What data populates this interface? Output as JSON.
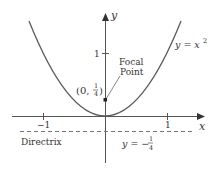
{
  "diagram": {
    "type": "parabola-focus-directrix",
    "curve": {
      "equation_lhs": "y = x",
      "equation_exp": "2",
      "color": "#5a5a5a"
    },
    "axes": {
      "x_label": "x",
      "y_label": "y",
      "x_ticks": [
        {
          "value": -1,
          "label": "−1"
        },
        {
          "value": 1,
          "label": "1"
        }
      ],
      "y_ticks": [
        {
          "value": 1,
          "label": "1"
        }
      ],
      "color": "#444444"
    },
    "focal_point": {
      "label_line1": "Focal",
      "label_line2": "Point",
      "coord_open": "(0,",
      "coord_num": "1",
      "coord_den": "4",
      "coord_close": ")",
      "x": 0,
      "y": 0.25
    },
    "directrix": {
      "label": "Directrix",
      "eq_lhs": "y = −",
      "eq_num": "1",
      "eq_den": "4",
      "y": -0.25,
      "style": "dashed"
    }
  }
}
